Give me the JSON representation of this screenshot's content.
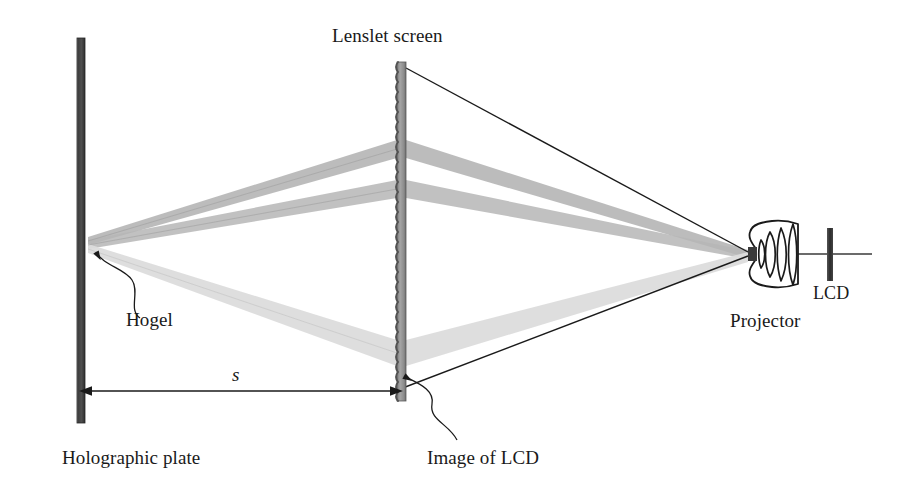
{
  "figure": {
    "type": "optical-ray-diagram",
    "width": 909,
    "height": 491,
    "background_color": "#ffffff"
  },
  "labels": {
    "lenslet_screen": "Lenslet screen",
    "hogel": "Hogel",
    "holographic_plate": "Holographic plate",
    "image_of_lcd": "Image of LCD",
    "distance_symbol": "s",
    "projector": "Projector",
    "lcd": "LCD"
  },
  "components": {
    "holographic_plate": {
      "name": "Holographic plate",
      "x": 77,
      "y_top": 38,
      "y_bottom": 423,
      "width": 8,
      "color": "#4a4a4a"
    },
    "lenslet_screen": {
      "name": "Lenslet screen",
      "x": 397,
      "y_top": 62,
      "y_bottom": 401,
      "width": 9,
      "color": "#8c8c8c",
      "edge": "scalloped lenslet array"
    },
    "projector": {
      "name": "Projector",
      "center_x": 775,
      "center_y": 253,
      "lens_elements": 4,
      "entrance_pupil_x": 748,
      "entrance_pupil_y": 254
    },
    "lcd": {
      "name": "LCD",
      "x": 828,
      "y_top": 228,
      "y_bottom": 280,
      "width": 5,
      "color": "#3a3a3a"
    }
  },
  "dimension": {
    "symbol": "s",
    "from": "Holographic plate",
    "to": "Image of LCD",
    "x_start": 88,
    "x_end": 393,
    "y": 391
  },
  "rays": {
    "description": "Three light cones from the projector pupil through the lenslet screen converging at the hogel on the holographic plate",
    "converge_left": {
      "x": 88,
      "y": 241
    },
    "converge_right": {
      "x": 748,
      "y": 254
    },
    "beams": [
      {
        "id": "beam-upper",
        "screen_y": 148,
        "shade": "#a8a8a8"
      },
      {
        "id": "beam-middle",
        "screen_y": 188,
        "shade": "#b4b4b4"
      },
      {
        "id": "beam-lower",
        "screen_y": 352,
        "shade": "#d8d8d8"
      }
    ],
    "outline_lines": [
      {
        "id": "ray-outline-top",
        "from_x": 406,
        "from_y": 68,
        "to_x": 748,
        "to_y": 252
      },
      {
        "id": "ray-outline-bottom",
        "from_x": 402,
        "from_y": 388,
        "to_x": 748,
        "to_y": 256
      }
    ]
  },
  "colors": {
    "ink": "#1a1a1a",
    "plate_dark": "#4a4a4a",
    "screen_gray": "#8c8c8c",
    "beam_light": "#dcdcdc",
    "beam_mid": "#b0b0b0",
    "beam_dark": "#9a9a9a",
    "background": "#ffffff"
  }
}
